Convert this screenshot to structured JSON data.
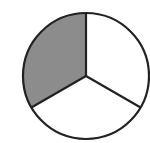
{
  "diagram": {
    "type": "fraction-circle",
    "parts": 3,
    "shaded_parts": 1,
    "fraction": "1/3",
    "shaded_color": "#8c8c8c",
    "unshaded_color": "#ffffff",
    "stroke_color": "#222222"
  }
}
